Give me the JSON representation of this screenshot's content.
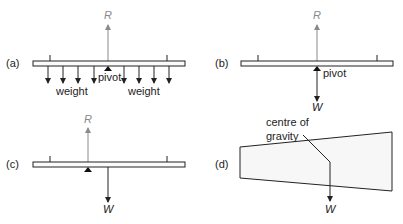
{
  "colors": {
    "ink": "#222222",
    "reaction": "#8a8a8a",
    "beam_fill": "#fbfbfb",
    "shape_fill": "#f7f7f7"
  },
  "panels": {
    "a": {
      "label": "(a)",
      "reaction_symbol": "R",
      "pivot_label": "pivot",
      "weight_left_label": "weight",
      "weight_right_label": "weight"
    },
    "b": {
      "label": "(b)",
      "reaction_symbol": "R",
      "pivot_label": "pivot",
      "weight_symbol": "W"
    },
    "c": {
      "label": "(c)",
      "reaction_symbol": "R",
      "weight_symbol": "W"
    },
    "d": {
      "label": "(d)",
      "cog_line1": "centre of",
      "cog_line2": "gravity",
      "weight_symbol": "W"
    }
  }
}
